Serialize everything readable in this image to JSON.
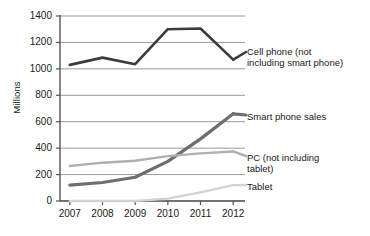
{
  "chart_data": {
    "type": "line",
    "title": "",
    "subtitle": "",
    "xlabel": "",
    "ylabel": "Millions",
    "categories": [
      "2007",
      "2008",
      "2009",
      "2010",
      "2011",
      "2012"
    ],
    "x": [
      2007,
      2008,
      2009,
      2010,
      2011,
      2012
    ],
    "ylim": [
      0,
      1400
    ],
    "ytick_labels": [
      "1400",
      "1200",
      "1000",
      "800",
      "600",
      "400",
      "200",
      "0"
    ],
    "ytick_values": [
      1400,
      1200,
      1000,
      800,
      600,
      400,
      200,
      0
    ],
    "grid": true,
    "grid_axis": "y",
    "legend_position": "inline-right",
    "series": [
      {
        "name": "Cell phone (not including smart phone)",
        "label_lines": "Cell phone (not\nincluding smart phone)",
        "color": "#3c3c3c",
        "width": 2.6,
        "values": [
          1030,
          1085,
          1035,
          1300,
          1305,
          1070
        ]
      },
      {
        "name": "Smart phone sales",
        "label_lines": "Smart phone sales",
        "color": "#6e6e6e",
        "width": 3.2,
        "values": [
          120,
          140,
          180,
          300,
          470,
          660
        ]
      },
      {
        "name": "PC (not including tablet)",
        "label_lines": "PC (not including\ntablet)",
        "color": "#b0b0b0",
        "width": 2.4,
        "values": [
          265,
          290,
          305,
          340,
          360,
          375
        ]
      },
      {
        "name": "Tablet",
        "label_lines": "Tablet",
        "color": "#d2d2d2",
        "width": 2.4,
        "values": [
          0,
          0,
          0,
          18,
          65,
          120
        ]
      }
    ],
    "colors": {
      "axis": "#555555",
      "grid": "#9a9a9a",
      "text": "#1a1a1a",
      "background": "#ffffff"
    }
  },
  "axis": {
    "y_title": "Millions",
    "yticks": [
      "1400",
      "1200",
      "1000",
      "800",
      "600",
      "400",
      "200",
      "0"
    ],
    "xticks": [
      "2007",
      "2008",
      "2009",
      "2010",
      "2011",
      "2012"
    ]
  },
  "labels": {
    "cell_phone": "Cell phone (not\nincluding smart phone)",
    "smart_phone": "Smart phone sales",
    "pc": "PC (not including\ntablet)",
    "tablet": "Tablet"
  }
}
